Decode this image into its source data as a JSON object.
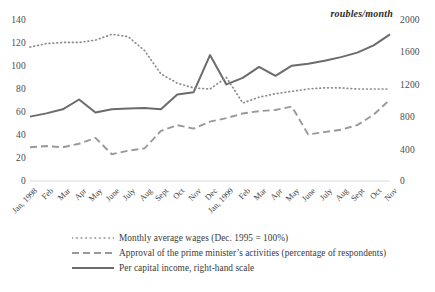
{
  "units_label": "roubles/month",
  "axis": {
    "left_ticks": [
      "140",
      "120",
      "100",
      "80",
      "60",
      "40",
      "20",
      "0"
    ],
    "right_ticks": [
      "2000",
      "1600",
      "1200",
      "800",
      "400",
      "0"
    ],
    "left_range": [
      0,
      140
    ],
    "right_range": [
      0,
      2000
    ]
  },
  "legend": {
    "items": [
      {
        "name": "wages",
        "style": "dotted",
        "label": "Monthly average wages (Dec. 1995 = 100%)"
      },
      {
        "name": "approval",
        "style": "dashed",
        "label": "Approval of the prime minister’s activities (percentage of respondents)"
      },
      {
        "name": "income",
        "style": "solid",
        "label": "Per capital income, right-hand scale"
      }
    ]
  },
  "chart_data": {
    "type": "line",
    "title": "",
    "xlabel": "",
    "ylabel": "",
    "y2label": "roubles/month",
    "ylim": [
      0,
      140
    ],
    "y2lim": [
      0,
      2000
    ],
    "grid": false,
    "legend_position": "bottom",
    "categories": [
      "Jan, 1998",
      "Feb",
      "Mar",
      "Apr",
      "May",
      "June",
      "July",
      "Aug",
      "Sept",
      "Oct",
      "Nov",
      "Dec",
      "Jan, 1999",
      "Feb",
      "Mar",
      "Apr",
      "May",
      "June",
      "July",
      "Aug",
      "Sept",
      "Oct",
      "Nov"
    ],
    "series": [
      {
        "name": "Monthly average wages (Dec. 1995 = 100%)",
        "style": "dotted",
        "axis": "left",
        "color": "#8a8a8a",
        "values": [
          115,
          118,
          119,
          119,
          121,
          126,
          124,
          112,
          92,
          84,
          80,
          79,
          89,
          67,
          72,
          75,
          77,
          79,
          80,
          80,
          79,
          79,
          79
        ]
      },
      {
        "name": "Approval of the prime minister’s activities (percentage of respondents)",
        "style": "dashed",
        "axis": "left",
        "color": "#999999",
        "values": [
          29,
          30,
          29,
          32,
          37,
          23,
          26,
          28,
          43,
          48,
          45,
          51,
          54,
          58,
          60,
          61,
          64,
          40,
          42,
          44,
          48,
          57,
          70
        ]
      },
      {
        "name": "Per capital income, right-hand scale",
        "style": "solid",
        "axis": "right",
        "color": "#6b6b6b",
        "values": [
          790,
          830,
          880,
          1000,
          840,
          880,
          890,
          895,
          880,
          1060,
          1090,
          1545,
          1185,
          1265,
          1400,
          1290,
          1415,
          1440,
          1475,
          1520,
          1575,
          1665,
          1800
        ]
      }
    ]
  }
}
